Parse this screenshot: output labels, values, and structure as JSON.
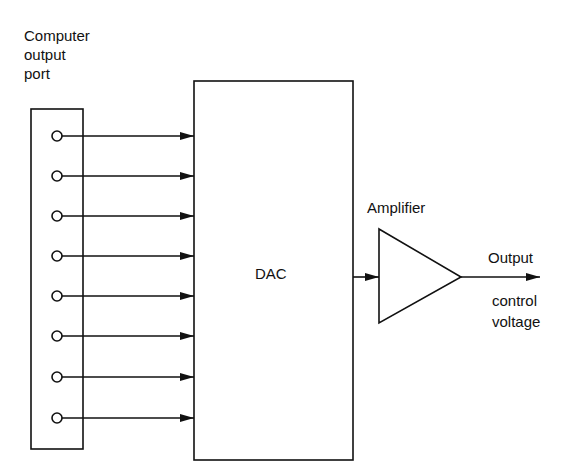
{
  "labels": {
    "port_line1": "Computer",
    "port_line2": "output",
    "port_line3": "port",
    "dac": "DAC",
    "amplifier": "Amplifier",
    "output_line1": "Output",
    "output_line2": "control",
    "output_line3": "voltage"
  },
  "port": {
    "bit_count": 8
  },
  "colors": {
    "line": "#111111",
    "background": "#ffffff"
  }
}
